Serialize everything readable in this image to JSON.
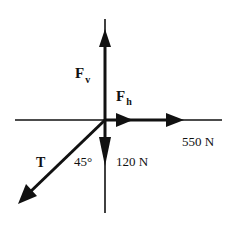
{
  "diagram": {
    "title": "",
    "type": "free-body force diagram",
    "colors": {
      "line": "#111111",
      "background": "#ffffff"
    },
    "labels": {
      "fv_main": "F",
      "fv_sub": "v",
      "fh_main": "F",
      "fh_sub": "h",
      "horizontal_force": "550 N",
      "tension": "T",
      "angle": "45°",
      "vertical_force": "120 N"
    },
    "forces": [
      {
        "name": "Fv",
        "direction": "up"
      },
      {
        "name": "Fh",
        "direction": "right"
      },
      {
        "name": "550 N",
        "direction": "right",
        "magnitude": 550,
        "unit": "N"
      },
      {
        "name": "120 N",
        "direction": "down",
        "magnitude": 120,
        "unit": "N"
      },
      {
        "name": "T",
        "direction": "down-left",
        "angle_deg": 45
      }
    ]
  }
}
